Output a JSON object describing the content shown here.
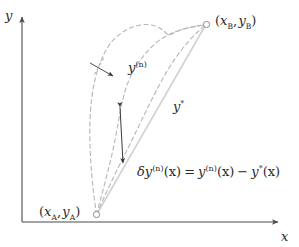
{
  "figure": {
    "kind": "calculus-of-variations-diagram",
    "background_color": "#ffffff",
    "axes": {
      "x_axis_label": "x",
      "y_axis_label": "y",
      "axis_color": "#4a4a4a",
      "origin_px": [
        22,
        222
      ],
      "x_axis_end_px": [
        281,
        222
      ],
      "y_axis_end_px": [
        22,
        14
      ]
    },
    "endpoints": {
      "a": {
        "label_full": "(xA, yA)",
        "label_paren_open": "(",
        "label_x_var": "x",
        "label_x_sub": "A",
        "label_comma": ",",
        "label_y_var": "y",
        "label_y_sub": "A",
        "label_paren_close": ")",
        "marker": "open-circle",
        "position_px": [
          96,
          215
        ]
      },
      "b": {
        "label_full": "(xB, yB)",
        "label_paren_open": "(",
        "label_x_var": "x",
        "label_x_sub": "B",
        "label_comma": ",",
        "label_y_var": "y",
        "label_y_sub": "B",
        "label_paren_close": ")",
        "marker": "open-circle",
        "position_px": [
          207,
          24
        ]
      }
    },
    "annotations": {
      "varied_path": {
        "var": "y",
        "superscript": "(n)",
        "text": "y(n)",
        "pointer": "arrow pointing right-down to dashed curves"
      },
      "extremal_path": {
        "var": "y",
        "superscript": "*",
        "text": "y*"
      },
      "variation_equation": {
        "delta": "δ",
        "lhs_var": "y",
        "lhs_sup": "(n)",
        "lhs_arg": "(x)",
        "equals": "=",
        "rhs1_var": "y",
        "rhs1_sup": "(n)",
        "rhs1_arg": "(x)",
        "minus": "−",
        "rhs2_var": "y",
        "rhs2_sup": "*",
        "rhs2_arg": "(x)",
        "full_text": "δy(n)(x) = y(n)(x) − y*(x)"
      }
    },
    "colors": {
      "dashed_curve": "#b9b9b9",
      "solid_extremal": "#d2d2d2",
      "arrow": "#3a3a3a",
      "axis": "#4a4a4a",
      "text": "#2a2a2a",
      "marker_stroke": "#8a8a8a"
    },
    "double_arrow": {
      "name": "variation-gap-arrow",
      "top_px": [
        120,
        104
      ],
      "bottom_px": [
        123,
        166
      ],
      "style": "double-headed vertical"
    }
  }
}
